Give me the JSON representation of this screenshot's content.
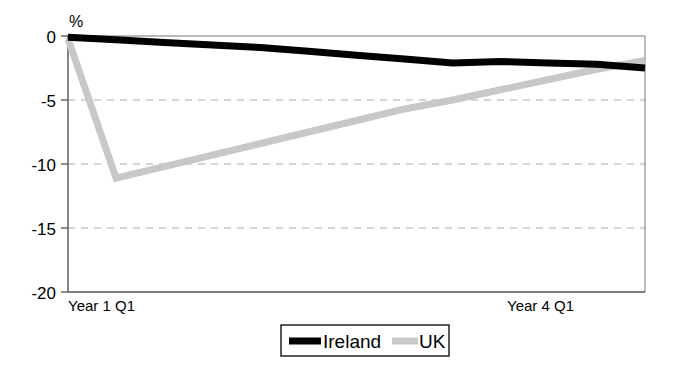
{
  "chart_data": {
    "type": "line",
    "title": "",
    "subtitle": "",
    "xlabel": "",
    "ylabel": "%",
    "unit_label": "%",
    "ylim": [
      -20,
      0
    ],
    "yticks": [
      0,
      -5,
      -10,
      -15,
      -20
    ],
    "ytick_labels": [
      "0",
      "-5",
      "-10",
      "-15",
      "-20"
    ],
    "xtick_labels": [
      "Year 1 Q1",
      "Year 4 Q1"
    ],
    "x_range_label_left": "Year 1 Q1",
    "x_range_label_right": "Year 4 Q1",
    "grid": "horizontal-dashed",
    "legend_position": "bottom-center",
    "x": [
      0,
      1,
      2,
      3,
      4,
      5,
      6,
      7,
      8,
      9,
      10,
      11,
      12
    ],
    "series": [
      {
        "name": "Ireland",
        "color": "#000000",
        "values": [
          -0.1,
          -0.3,
          -0.5,
          -0.7,
          -0.9,
          -1.2,
          -1.5,
          -1.8,
          -2.1,
          -2.0,
          -2.1,
          -2.2,
          -2.5
        ]
      },
      {
        "name": "UK",
        "color": "#c8c8c8",
        "values": [
          -0.2,
          -11.1,
          -10.2,
          -9.3,
          -8.4,
          -7.5,
          -6.6,
          -5.7,
          -5.0,
          -4.2,
          -3.4,
          -2.6,
          -1.9
        ]
      }
    ]
  },
  "legend": {
    "items": [
      {
        "label": "Ireland",
        "color": "#000000",
        "style": "thick-solid"
      },
      {
        "label": "UK",
        "color": "#c8c8c8",
        "style": "thick-solid"
      }
    ]
  },
  "axes": {
    "y_unit": "%",
    "y_labels": [
      "0",
      "-5",
      "-10",
      "-15",
      "-20"
    ],
    "x_labels": [
      "Year 1 Q1",
      "Year 4 Q1"
    ]
  }
}
